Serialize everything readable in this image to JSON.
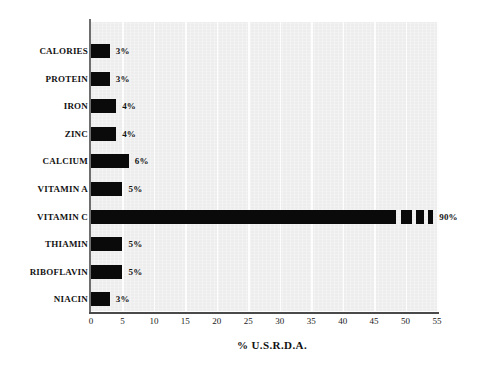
{
  "chart_data": {
    "type": "bar",
    "orientation": "horizontal",
    "title": "",
    "xlabel": "% U.S.R.D.A.",
    "ylabel": "",
    "xlim": [
      0,
      55
    ],
    "xticks": [
      "0",
      "5",
      "10",
      "15",
      "20",
      "25",
      "30",
      "35",
      "40",
      "45",
      "50",
      "55"
    ],
    "xtick_values": [
      0,
      5,
      10,
      15,
      20,
      25,
      30,
      35,
      40,
      45,
      50,
      55
    ],
    "grid": true,
    "grid_axis": "x",
    "legend": false,
    "bar_color": "#0a0a0a",
    "plot_background": "#efefef",
    "page_background": "#ffffff",
    "categories": [
      "CALORIES",
      "PROTEIN",
      "IRON",
      "ZINC",
      "CALCIUM",
      "VITAMIN A",
      "VITAMIN C",
      "THIAMIN",
      "RIBOFLAVIN",
      "NIACIN"
    ],
    "values": [
      3,
      3,
      4,
      4,
      6,
      5,
      90,
      5,
      5,
      3
    ],
    "data_labels": [
      "3%",
      "3%",
      "4%",
      "4%",
      "6%",
      "5%",
      "90%",
      "5%",
      "5%",
      "3%"
    ],
    "bars": [
      {
        "category": "CALORIES",
        "value": 3,
        "label": "3%",
        "broken": false
      },
      {
        "category": "PROTEIN",
        "value": 3,
        "label": "3%",
        "broken": false
      },
      {
        "category": "IRON",
        "value": 4,
        "label": "4%",
        "broken": false
      },
      {
        "category": "ZINC",
        "value": 4,
        "label": "4%",
        "broken": false
      },
      {
        "category": "CALCIUM",
        "value": 6,
        "label": "6%",
        "broken": false
      },
      {
        "category": "VITAMIN A",
        "value": 5,
        "label": "5%",
        "broken": false
      },
      {
        "category": "VITAMIN C",
        "value": 90,
        "label": "90%",
        "broken": true
      },
      {
        "category": "THIAMIN",
        "value": 5,
        "label": "5%",
        "broken": false
      },
      {
        "category": "RIBOFLAVIN",
        "value": 5,
        "label": "5%",
        "broken": false
      },
      {
        "category": "NIACIN",
        "value": 3,
        "label": "3%",
        "broken": false
      }
    ]
  }
}
